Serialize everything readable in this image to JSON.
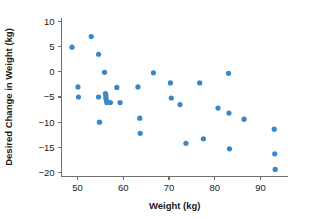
{
  "chart_data": {
    "type": "scatter",
    "title": "",
    "xlabel": "Weight (kg)",
    "ylabel": "Desired Change in Weight (kg)",
    "xlim": [
      46.5,
      96
    ],
    "ylim": [
      -20.8,
      10.8
    ],
    "xticks": [
      50,
      60,
      70,
      80,
      90
    ],
    "yticks": [
      10,
      5,
      0,
      -5,
      -10,
      -15,
      -20
    ],
    "xtick_labels": [
      "50",
      "60",
      "70",
      "80",
      "90"
    ],
    "ytick_labels": [
      "10",
      "5",
      "0",
      "-5",
      "-10",
      "-15",
      "-20"
    ],
    "grid": false,
    "legend": null,
    "marker_color": "#3b87c6",
    "marker_size": 2.6,
    "axis_color": "#6e6e6e",
    "series": [
      {
        "name": "participants",
        "x": [
          48.8,
          50.1,
          50.2,
          53.0,
          54.6,
          54.6,
          54.8,
          55.9,
          56.1,
          56.2,
          56.2,
          56.3,
          56.4,
          57.2,
          58.6,
          59.3,
          63.2,
          63.6,
          63.7,
          66.6,
          70.3,
          70.5,
          72.4,
          73.7,
          76.7,
          77.5,
          80.7,
          83.0,
          83.1,
          83.2,
          86.4,
          93.0,
          93.1,
          93.2
        ],
        "y": [
          4.9,
          -3.0,
          -5.0,
          7.0,
          3.5,
          -5.0,
          -10.0,
          -0.1,
          -4.3,
          -4.7,
          -5.2,
          -5.6,
          -6.1,
          -6.1,
          -3.1,
          -6.1,
          -3.0,
          -9.2,
          -12.2,
          -0.2,
          -2.2,
          -5.2,
          -6.5,
          -14.2,
          -2.2,
          -13.3,
          -7.2,
          -0.3,
          -8.2,
          -15.3,
          -9.4,
          -11.4,
          -16.3,
          -19.4
        ]
      }
    ]
  }
}
